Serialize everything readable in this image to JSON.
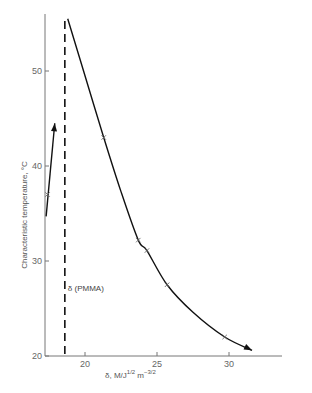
{
  "chart_data": {
    "type": "line",
    "title": "",
    "xlabel": "δ, M/J^1/2 m^-3/2",
    "xlabel_parts": {
      "main": "δ,  M/J",
      "sup1": "1/2",
      "mid": " m",
      "sup2": "−3/2"
    },
    "ylabel": "Characteristic temperature, °C",
    "xlim": [
      17.2,
      34.5
    ],
    "ylim": [
      20,
      56
    ],
    "x_ticks": [
      20,
      25,
      30
    ],
    "y_ticks": [
      20,
      30,
      40,
      50
    ],
    "grid": false,
    "legend": null,
    "series": [
      {
        "name": "main curve",
        "style": "solid with arrow at upper end",
        "points": [
          {
            "x": 18.8,
            "y": 55.5
          },
          {
            "x": 20.0,
            "y": 49.5
          },
          {
            "x": 21.3,
            "y": 43.0
          },
          {
            "x": 22.5,
            "y": 37.3
          },
          {
            "x": 23.7,
            "y": 32.2
          },
          {
            "x": 24.3,
            "y": 31.1
          },
          {
            "x": 25.7,
            "y": 27.5
          },
          {
            "x": 27.5,
            "y": 24.6
          },
          {
            "x": 29.7,
            "y": 22.0
          },
          {
            "x": 31.6,
            "y": 20.6
          }
        ],
        "markers": [
          {
            "x": 21.3,
            "y": 43.0
          },
          {
            "x": 23.7,
            "y": 32.2
          },
          {
            "x": 24.3,
            "y": 31.1
          },
          {
            "x": 25.7,
            "y": 27.5
          },
          {
            "x": 29.7,
            "y": 22.0
          }
        ]
      },
      {
        "name": "short arrow",
        "style": "solid with arrow at upper end",
        "points": [
          {
            "x": 17.3,
            "y": 34.7
          },
          {
            "x": 17.9,
            "y": 44.5
          }
        ],
        "markers": [
          {
            "x": 17.4,
            "y": 37.0
          }
        ]
      }
    ],
    "reference_lines": [
      {
        "type": "vertical",
        "x": 18.6,
        "style": "dashed",
        "label": "δ (PMMA)"
      }
    ]
  },
  "annotation": {
    "pmma_label": "δ (PMMA)"
  }
}
